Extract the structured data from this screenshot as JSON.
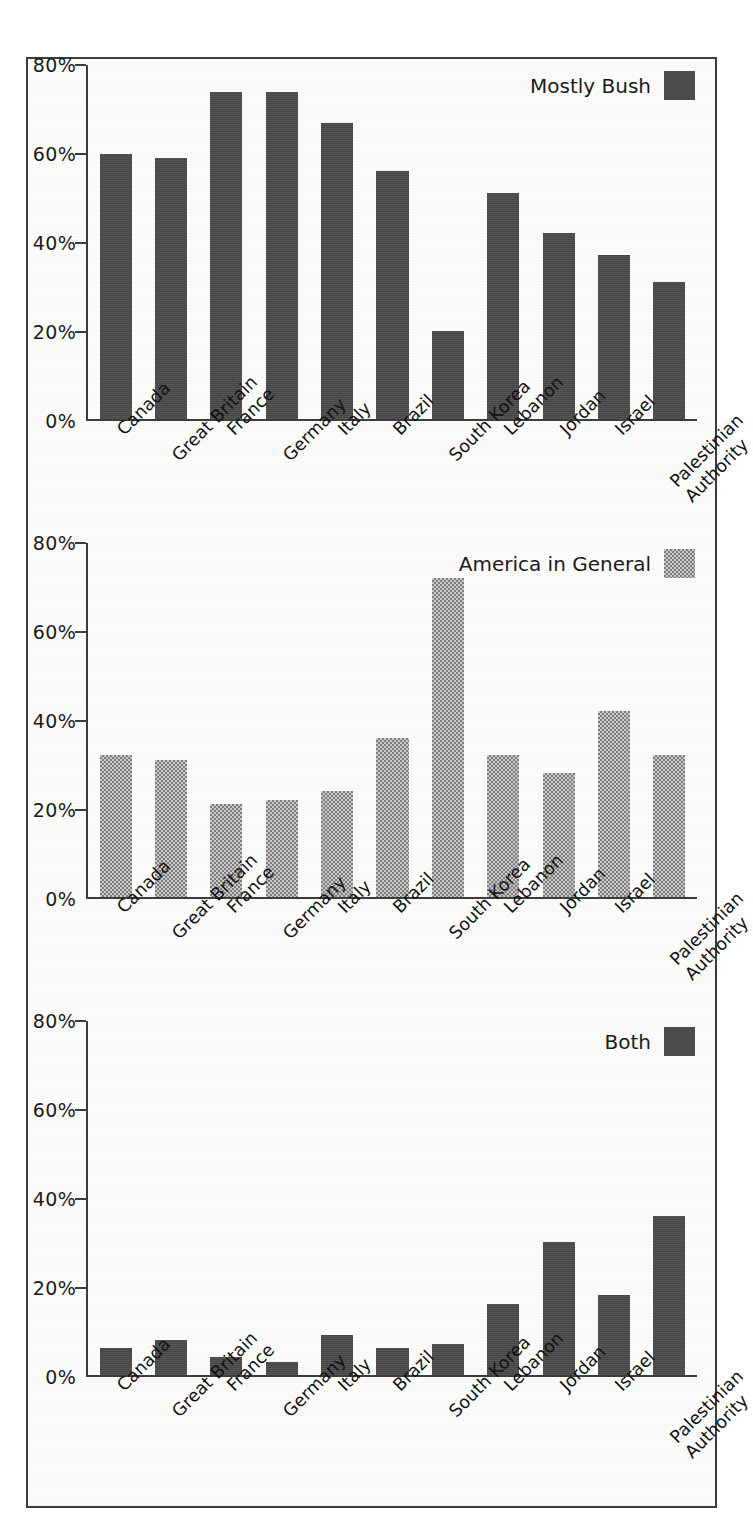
{
  "chart_data": [
    {
      "type": "bar",
      "title": "",
      "legend_label": "Mostly Bush",
      "legend_position": "top-right",
      "legend_swatch_style": "solid-dark",
      "series_color": "#4b4b4b",
      "xlabel": "",
      "ylabel": "",
      "ylim": [
        0,
        80
      ],
      "grid": false,
      "ytick_labels": [
        "80%",
        "60%",
        "40%",
        "20%",
        "0%"
      ],
      "ytick_values": [
        80,
        60,
        40,
        20,
        0
      ],
      "categories": [
        "Canada",
        "Great Britain",
        "France",
        "Germany",
        "Italy",
        "Brazil",
        "South Korea",
        "Lebanon",
        "Jordan",
        "Israel",
        "Palestinian Authority"
      ],
      "values": [
        60,
        59,
        74,
        74,
        67,
        56,
        20,
        51,
        42,
        37,
        31
      ]
    },
    {
      "type": "bar",
      "title": "",
      "legend_label": "America in General",
      "legend_position": "top-right",
      "legend_swatch_style": "dither-gray",
      "series_color": "#a4a4a4",
      "xlabel": "",
      "ylabel": "",
      "ylim": [
        0,
        80
      ],
      "grid": false,
      "ytick_labels": [
        "80%",
        "60%",
        "40%",
        "20%",
        "0%"
      ],
      "ytick_values": [
        80,
        60,
        40,
        20,
        0
      ],
      "categories": [
        "Canada",
        "Great Britain",
        "France",
        "Germany",
        "Italy",
        "Brazil",
        "South Korea",
        "Lebanon",
        "Jordan",
        "Israel",
        "Palestinian Authority"
      ],
      "values": [
        32,
        31,
        21,
        22,
        24,
        36,
        72,
        32,
        28,
        42,
        32
      ]
    },
    {
      "type": "bar",
      "title": "",
      "legend_label": "Both",
      "legend_position": "top-right",
      "legend_swatch_style": "solid-dark",
      "series_color": "#4b4b4b",
      "xlabel": "",
      "ylabel": "",
      "ylim": [
        0,
        80
      ],
      "grid": false,
      "ytick_labels": [
        "80%",
        "60%",
        "40%",
        "20%",
        "0%"
      ],
      "ytick_values": [
        80,
        60,
        40,
        20,
        0
      ],
      "categories": [
        "Canada",
        "Great Britain",
        "France",
        "Germany",
        "Italy",
        "Brazil",
        "South Korea",
        "Lebanon",
        "Jordan",
        "Israel",
        "Palestinian Authority"
      ],
      "values": [
        6,
        8,
        4,
        3,
        9,
        6,
        7,
        16,
        30,
        18,
        36
      ]
    }
  ],
  "figure": {
    "border_color": "#3c3c3c",
    "background_color": "#fbfbfa"
  }
}
